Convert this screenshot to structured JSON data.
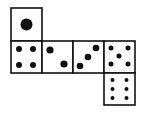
{
  "diagram": {
    "type": "cube-net",
    "colors": {
      "stroke": "#111111",
      "pip": "#111111",
      "background": "#ffffff"
    },
    "faces": [
      {
        "name": "face-one",
        "value": 1,
        "x": 11,
        "y": 8,
        "pips": [
          [
            15.5,
            16.5,
            6
          ]
        ]
      },
      {
        "name": "face-four",
        "value": 4,
        "x": 11,
        "y": 41,
        "pips": [
          [
            8,
            8,
            3
          ],
          [
            22,
            8,
            3
          ],
          [
            8,
            24,
            3
          ],
          [
            22,
            24,
            3
          ]
        ]
      },
      {
        "name": "face-two",
        "value": 2,
        "x": 42,
        "y": 41,
        "pips": [
          [
            8,
            9,
            3.6
          ],
          [
            22,
            23,
            3.6
          ]
        ]
      },
      {
        "name": "face-three",
        "value": 3,
        "x": 73,
        "y": 41,
        "pips": [
          [
            23,
            7,
            3.3
          ],
          [
            15,
            16,
            3.3
          ],
          [
            7,
            25,
            3.3
          ]
        ]
      },
      {
        "name": "face-five",
        "value": 5,
        "x": 104,
        "y": 41,
        "pips": [
          [
            7,
            7,
            2.5
          ],
          [
            24,
            7,
            2.5
          ],
          [
            15,
            15,
            2.5
          ],
          [
            7,
            23,
            2.5
          ],
          [
            24,
            23,
            2.5
          ]
        ]
      },
      {
        "name": "face-six",
        "value": 6,
        "x": 104,
        "y": 73,
        "pips": [
          [
            8.5,
            7,
            2
          ],
          [
            22.5,
            7,
            2
          ],
          [
            8.5,
            16,
            2
          ],
          [
            22.5,
            16,
            2
          ],
          [
            8.5,
            25,
            2
          ],
          [
            22.5,
            25,
            2
          ]
        ]
      }
    ],
    "face_size": 31
  }
}
